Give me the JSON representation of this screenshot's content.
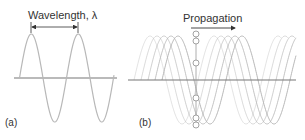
{
  "panels": [
    {
      "id": "a",
      "label": "(a)",
      "annotation": "Wavelength, λ",
      "colors": {
        "wave": "#b8b8b8",
        "axis": "#777777",
        "arrow": "#333333"
      }
    },
    {
      "id": "b",
      "label": "(b)",
      "annotation": "Propagation",
      "colors": {
        "wave": "#c8c8c8",
        "axis": "#777777",
        "arrow": "#333333",
        "marker": "#aaaaaa"
      }
    }
  ]
}
